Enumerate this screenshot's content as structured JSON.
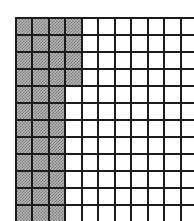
{
  "figure": {
    "type": "grid-diagram"
  },
  "chart_data": {
    "type": "heatmap",
    "title": "",
    "xlabel": "",
    "ylabel": "",
    "columns": 11,
    "rows": 12,
    "legend": [
      {
        "key": "gray",
        "label": "shaded cell",
        "color": "#9a9a9a"
      },
      {
        "key": "white",
        "label": "empty cell",
        "color": "#ffffff"
      }
    ],
    "grid_line_color": "#1c1c1c",
    "grid_on": true,
    "cells": [
      [
        "gray",
        "gray",
        "gray",
        "gray",
        "white",
        "white",
        "white",
        "white",
        "white",
        "white",
        "white"
      ],
      [
        "gray",
        "gray",
        "gray",
        "gray",
        "white",
        "white",
        "white",
        "white",
        "white",
        "white",
        "white"
      ],
      [
        "gray",
        "gray",
        "gray",
        "gray",
        "white",
        "white",
        "white",
        "white",
        "white",
        "white",
        "white"
      ],
      [
        "gray",
        "gray",
        "gray",
        "gray",
        "white",
        "white",
        "white",
        "white",
        "white",
        "white",
        "white"
      ],
      [
        "gray",
        "gray",
        "gray",
        "white",
        "white",
        "white",
        "white",
        "white",
        "white",
        "white",
        "white"
      ],
      [
        "gray",
        "gray",
        "gray",
        "white",
        "white",
        "white",
        "white",
        "white",
        "white",
        "white",
        "white"
      ],
      [
        "gray",
        "gray",
        "gray",
        "white",
        "white",
        "white",
        "white",
        "white",
        "white",
        "white",
        "white"
      ],
      [
        "gray",
        "gray",
        "gray",
        "white",
        "white",
        "white",
        "white",
        "white",
        "white",
        "white",
        "white"
      ],
      [
        "gray",
        "gray",
        "gray",
        "white",
        "white",
        "white",
        "white",
        "white",
        "white",
        "white",
        "white"
      ],
      [
        "gray",
        "gray",
        "gray",
        "white",
        "white",
        "white",
        "white",
        "white",
        "white",
        "white",
        "white"
      ],
      [
        "gray",
        "gray",
        "gray",
        "white",
        "white",
        "white",
        "white",
        "white",
        "white",
        "white",
        "white"
      ],
      [
        "gray",
        "gray",
        "gray",
        "white",
        "white",
        "white",
        "white",
        "white",
        "white",
        "white",
        "white"
      ]
    ],
    "shaded_count": 40,
    "total_count": 132
  },
  "colors": {
    "background": "#ffffff",
    "grid_line": "#1c1c1c",
    "shaded_fill": "#9a9a9a",
    "empty_fill": "#ffffff"
  }
}
